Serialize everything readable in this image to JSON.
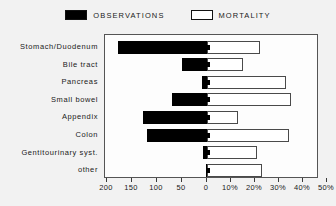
{
  "legend": {
    "entries": [
      {
        "label": "OBSERVATIONS",
        "style": "filled",
        "color": "#000000",
        "icon": "filled-square-icon"
      },
      {
        "label": "MORTALITY",
        "style": "hollow",
        "color": "#ffffff",
        "icon": "hollow-square-icon"
      }
    ]
  },
  "axis": {
    "left_ticks": [
      "200",
      "150",
      "100",
      "50",
      "0"
    ],
    "right_ticks": [
      "10%",
      "20%",
      "30%",
      "40%",
      "50%"
    ]
  },
  "chart_data": {
    "type": "bar",
    "orientation": "horizontal",
    "layout": "diverging-dual-axis",
    "title": "",
    "subtitle": "",
    "xlabel": "",
    "ylabel": "",
    "grid": false,
    "legend_position": "top-center",
    "categories": [
      "Stomach/Duodenum",
      "Bile tract",
      "Pancreas",
      "Small bowel",
      "Appendix",
      "Colon",
      "Gentitourinary syst.",
      "other"
    ],
    "series": [
      {
        "name": "OBSERVATIONS",
        "direction": "left",
        "axis_label": "observations (count)",
        "axis_ticks": [
          200,
          150,
          100,
          50,
          0
        ],
        "axis_range": [
          200,
          0
        ],
        "color": "#000000",
        "values": [
          178,
          50,
          10,
          70,
          128,
          120,
          8,
          2
        ]
      },
      {
        "name": "MORTALITY",
        "direction": "right",
        "axis_label": "mortality (%)",
        "axis_ticks": [
          0,
          10,
          20,
          30,
          40,
          50
        ],
        "axis_range": [
          0,
          50
        ],
        "color": "#ffffff",
        "values": [
          22,
          15,
          33,
          35,
          13,
          34,
          21,
          23
        ]
      }
    ]
  }
}
